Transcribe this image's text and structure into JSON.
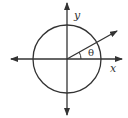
{
  "diagram": {
    "labels": {
      "y_axis": "y",
      "x_axis": "x",
      "angle": "θ"
    },
    "colors": {
      "stroke": "#333333",
      "background": "#ffffff"
    },
    "elements": [
      {
        "type": "circle",
        "name": "unit-circle"
      },
      {
        "type": "axis",
        "name": "x-axis",
        "arrows": "both"
      },
      {
        "type": "axis",
        "name": "y-axis",
        "arrows": "both"
      },
      {
        "type": "ray",
        "name": "terminal-ray",
        "arrow": "end"
      },
      {
        "type": "arc",
        "name": "angle-arc"
      }
    ]
  }
}
